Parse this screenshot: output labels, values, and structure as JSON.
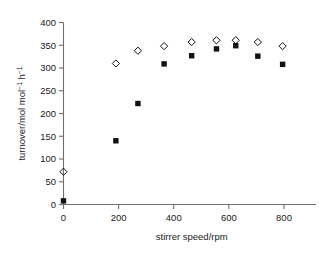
{
  "chart_data": {
    "type": "scatter",
    "title": "",
    "xlabel": "stirrer speed/rpm",
    "ylabel": "turnover/mol mol⁻¹ h⁻¹",
    "ylabel_parts": {
      "base1": "turnover/mol mol",
      "sup1": "−1",
      "base2": " h",
      "sup2": "−1"
    },
    "xlim": [
      0,
      900
    ],
    "ylim": [
      0,
      400
    ],
    "xticks": [
      0,
      200,
      400,
      600,
      800
    ],
    "xtick_labels": [
      "0",
      "200",
      "400",
      "600",
      "800"
    ],
    "yticks": [
      0,
      50,
      100,
      150,
      200,
      250,
      300,
      350,
      400
    ],
    "ytick_labels": [
      "0",
      "50",
      "100",
      "150",
      "200",
      "250",
      "300",
      "350",
      "400"
    ],
    "grid": false,
    "legend": "none",
    "series": [
      {
        "name": "open diamond",
        "marker": "diamond-open",
        "color": "#000000",
        "x": [
          0,
          190,
          270,
          365,
          465,
          555,
          625,
          705,
          795
        ],
        "values": [
          72,
          310,
          338,
          348,
          357,
          361,
          361,
          357,
          348
        ]
      },
      {
        "name": "filled square",
        "marker": "square-filled",
        "color": "#000000",
        "x": [
          0,
          190,
          270,
          365,
          465,
          555,
          625,
          705,
          795
        ],
        "values": [
          8,
          140,
          222,
          309,
          327,
          342,
          349,
          326,
          308
        ]
      }
    ]
  },
  "colors": {
    "axis": "#6f6f6f",
    "marker": "#111111",
    "background": "#ffffff"
  }
}
